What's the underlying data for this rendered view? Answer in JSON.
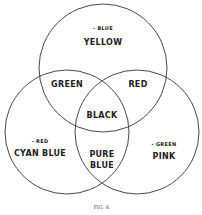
{
  "diagram": {
    "type": "venn",
    "circles": [
      {
        "name": "top",
        "cx": 103,
        "cy": 68,
        "r": 64
      },
      {
        "name": "left",
        "cx": 67,
        "cy": 132,
        "r": 62
      },
      {
        "name": "right",
        "cx": 137,
        "cy": 132,
        "r": 62
      }
    ],
    "regions": {
      "top": {
        "note": "- BLUE",
        "label": "YELLOW"
      },
      "top_left": {
        "label": "GREEN"
      },
      "top_right": {
        "label": "RED"
      },
      "center": {
        "label": "BLACK"
      },
      "left": {
        "note": "- RED",
        "label": "CYAN BLUE"
      },
      "bottom": {
        "label_line1": "PURE",
        "label_line2": "BLUE"
      },
      "right": {
        "note": "- GREEN",
        "label": "PINK"
      }
    },
    "caption": "FIG. 8."
  }
}
